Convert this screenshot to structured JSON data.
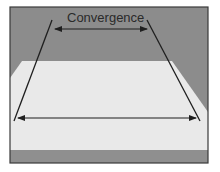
{
  "diagram": {
    "title_label": "Convergence",
    "colors": {
      "background": "#8c8c8c",
      "floor": "#e9e9e9",
      "floor_bottom_strip": "#8f8f8f",
      "frame": "#3a3a3a",
      "lines": "#1f1f1f"
    },
    "elements": [
      {
        "type": "converging-line",
        "side": "left"
      },
      {
        "type": "converging-line",
        "side": "right"
      },
      {
        "type": "double-arrow",
        "position": "top",
        "meaning": "narrow far width"
      },
      {
        "type": "double-arrow",
        "position": "bottom",
        "meaning": "wide near width"
      }
    ]
  }
}
